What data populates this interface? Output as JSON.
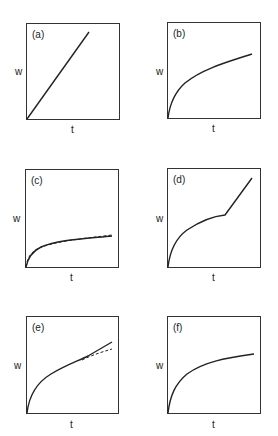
{
  "figure": {
    "panels": [
      {
        "id": "a",
        "label": "(a)",
        "xlabel": "t",
        "ylabel": "w",
        "curve": "linear"
      },
      {
        "id": "b",
        "label": "(b)",
        "xlabel": "t",
        "ylabel": "w",
        "curve": "parabolic"
      },
      {
        "id": "c",
        "label": "(c)",
        "xlabel": "t",
        "ylabel": "w",
        "curve": "logarithmic with dashed fit"
      },
      {
        "id": "d",
        "label": "(d)",
        "xlabel": "t",
        "ylabel": "w",
        "curve": "parabolic then linear breakaway"
      },
      {
        "id": "e",
        "label": "(e)",
        "xlabel": "t",
        "ylabel": "w",
        "curve": "paralinear with dashed parabolic extrapolation"
      },
      {
        "id": "f",
        "label": "(f)",
        "xlabel": "t",
        "ylabel": "w",
        "curve": "cubic/logarithmic"
      }
    ]
  }
}
